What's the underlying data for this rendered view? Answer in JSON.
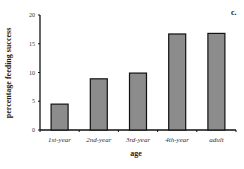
{
  "panel_label": "c.",
  "chart_data": {
    "type": "bar",
    "title": "",
    "xlabel": "age",
    "ylabel": "percentage feeding success",
    "categories": [
      "1st-year",
      "2nd-year",
      "3rd-year",
      "4th-year",
      "adult"
    ],
    "values": [
      4.5,
      8.9,
      9.9,
      16.7,
      16.8
    ],
    "ylim": [
      0,
      20
    ],
    "yticks": [
      0,
      5,
      10,
      15,
      20
    ],
    "grid": false,
    "legend": null,
    "bar_color": "#8c8c8c",
    "bar_edge_color": "#111111"
  }
}
